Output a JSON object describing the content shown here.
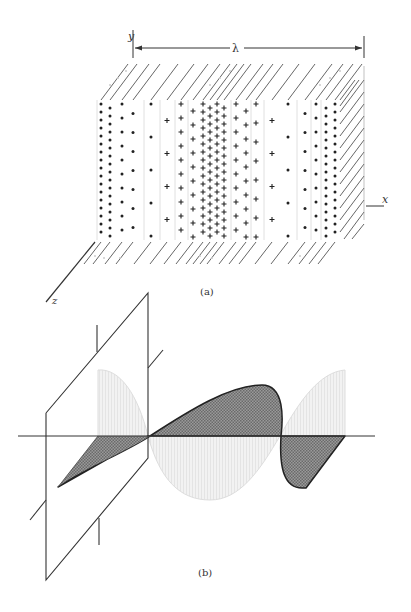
{
  "figure": {
    "panel_a": {
      "caption": "(a)",
      "axis_labels": {
        "y": "y",
        "x": "x",
        "z": "z"
      },
      "wavelength_label": "λ",
      "description": "Longitudinal wave in a slab: sheets of charge with density varying along x; dots (•) mark negative regions, plus signs (+) mark positive regions",
      "columns": [
        {
          "x": 101,
          "symbol": "dot",
          "dense": true
        },
        {
          "x": 110,
          "symbol": "dot",
          "dense": true
        },
        {
          "x": 122,
          "symbol": "dot",
          "dense": false
        },
        {
          "x": 133,
          "symbol": "dot",
          "dense": false,
          "sparse": true
        },
        {
          "x": 151,
          "symbol": "dot",
          "sparse": true,
          "very_sparse": true
        },
        {
          "x": 167,
          "symbol": "plus",
          "very_sparse": true
        },
        {
          "x": 181,
          "symbol": "plus",
          "sparse": false
        },
        {
          "x": 193,
          "symbol": "plus"
        },
        {
          "x": 203,
          "symbol": "plus",
          "dense": true
        },
        {
          "x": 210,
          "symbol": "plus",
          "dense": true
        },
        {
          "x": 217,
          "symbol": "plus",
          "dense": true
        },
        {
          "x": 224,
          "symbol": "plus",
          "dense": true
        },
        {
          "x": 236,
          "symbol": "plus"
        },
        {
          "x": 246,
          "symbol": "plus"
        },
        {
          "x": 256,
          "symbol": "plus",
          "sparse": true
        },
        {
          "x": 272,
          "symbol": "plus",
          "very_sparse": true
        },
        {
          "x": 288,
          "symbol": "dot",
          "very_sparse": true
        },
        {
          "x": 305,
          "symbol": "dot",
          "sparse": true
        },
        {
          "x": 316,
          "symbol": "dot"
        },
        {
          "x": 326,
          "symbol": "dot",
          "dense": true
        },
        {
          "x": 335,
          "symbol": "dot",
          "dense": true
        }
      ]
    },
    "panel_b": {
      "caption": "(b)",
      "description": "Sinusoidal wave (light, stippled) and the distorted/steepened wave (dark shaded) propagating along an axis, with a transverse reference plane at left"
    }
  }
}
